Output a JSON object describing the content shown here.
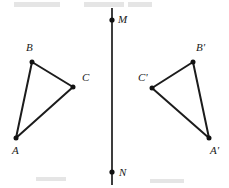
{
  "figure": {
    "background_color": "#ffffff",
    "stroke_color": "#1c1c1c",
    "width": 229,
    "height": 188
  },
  "mirror_line": {
    "name": "MN",
    "x": 112,
    "y_top": 8,
    "y_bottom": 185,
    "endpoints": [
      {
        "label": "M",
        "x": 112,
        "y": 20,
        "label_x": 118,
        "label_y": 20
      },
      {
        "label": "N",
        "x": 112,
        "y": 172,
        "label_x": 119,
        "label_y": 173
      }
    ]
  },
  "triangles": [
    {
      "name": "triangle-abc",
      "vertices": [
        {
          "label": "A",
          "x": 16,
          "y": 138,
          "label_x": 12,
          "label_y": 151
        },
        {
          "label": "B",
          "x": 32,
          "y": 62,
          "label_x": 26,
          "label_y": 48
        },
        {
          "label": "C",
          "x": 73,
          "y": 87,
          "label_x": 82,
          "label_y": 78
        }
      ]
    },
    {
      "name": "triangle-abc-prime",
      "vertices": [
        {
          "label": "A'",
          "x": 209,
          "y": 138,
          "label_x": 210,
          "label_y": 151
        },
        {
          "label": "B'",
          "x": 193,
          "y": 62,
          "label_x": 196,
          "label_y": 48
        },
        {
          "label": "C'",
          "x": 152,
          "y": 88,
          "label_x": 138,
          "label_y": 78
        }
      ]
    }
  ],
  "artifacts": [
    {
      "name": "top-smudge-left",
      "x": 14,
      "y": 2,
      "width": 46,
      "height": 5
    },
    {
      "name": "top-smudge-mid",
      "x": 84,
      "y": 2,
      "width": 40,
      "height": 5
    },
    {
      "name": "top-smudge-right",
      "x": 128,
      "y": 2,
      "width": 24,
      "height": 5
    },
    {
      "name": "bottom-smudge-left",
      "x": 36,
      "y": 177,
      "width": 30,
      "height": 4
    },
    {
      "name": "bottom-smudge-right",
      "x": 150,
      "y": 179,
      "width": 34,
      "height": 4
    }
  ]
}
